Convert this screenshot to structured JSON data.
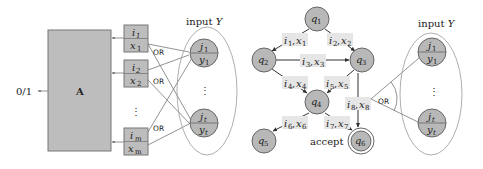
{
  "left_diagram": {
    "machine_label": "A",
    "output_label": "0/1",
    "input_label_prefix": "input ",
    "input_label_var": "Y",
    "query_boxes": [
      {
        "index": "i",
        "index_sub": "1",
        "value": "x",
        "value_sub": "1"
      },
      {
        "index": "i",
        "index_sub": "2",
        "value": "x",
        "value_sub": "2"
      },
      {
        "index": "i",
        "index_sub": "m",
        "value": "x",
        "value_sub": "m"
      }
    ],
    "input_nodes": [
      {
        "top": "j",
        "top_sub": "1",
        "bottom": "y",
        "bottom_sub": "1"
      },
      {
        "top": "j",
        "top_sub": "t",
        "bottom": "y",
        "bottom_sub": "t"
      }
    ],
    "or_labels": [
      "OR",
      "OR",
      "OR"
    ],
    "ellipsis": "⋮"
  },
  "right_diagram": {
    "states": [
      {
        "name": "q",
        "sub": "1"
      },
      {
        "name": "q",
        "sub": "2"
      },
      {
        "name": "q",
        "sub": "3"
      },
      {
        "name": "q",
        "sub": "4"
      },
      {
        "name": "q",
        "sub": "5"
      },
      {
        "name": "q",
        "sub": "6"
      }
    ],
    "edges": [
      {
        "from": "q1",
        "to": "q2",
        "i": "i",
        "i_sub": "1",
        "x": "x",
        "x_sub": "1"
      },
      {
        "from": "q1",
        "to": "q3",
        "i": "i",
        "i_sub": "2",
        "x": "x",
        "x_sub": "2"
      },
      {
        "from": "q2",
        "to": "q3",
        "i": "i",
        "i_sub": "3",
        "x": "x",
        "x_sub": "3"
      },
      {
        "from": "q2",
        "to": "q4",
        "i": "i",
        "i_sub": "4",
        "x": "x",
        "x_sub": "4"
      },
      {
        "from": "q3",
        "to": "q4",
        "i": "i",
        "i_sub": "5",
        "x": "x",
        "x_sub": "5"
      },
      {
        "from": "q4",
        "to": "q5",
        "i": "i",
        "i_sub": "6",
        "x": "x",
        "x_sub": "6"
      },
      {
        "from": "q4",
        "to": "q6",
        "i": "i",
        "i_sub": "7",
        "x": "x",
        "x_sub": "7"
      },
      {
        "from": "q3",
        "to": "q6",
        "i": "i",
        "i_sub": "8",
        "x": "x",
        "x_sub": "8"
      }
    ],
    "accept_label": "accept",
    "or_label": "OR",
    "input_label_prefix": "input ",
    "input_label_var": "Y",
    "input_nodes": [
      {
        "top": "j",
        "top_sub": "1",
        "bottom": "y",
        "bottom_sub": "1"
      },
      {
        "top": "j",
        "top_sub": "t",
        "bottom": "y",
        "bottom_sub": "t"
      }
    ],
    "ellipsis": "⋮"
  }
}
